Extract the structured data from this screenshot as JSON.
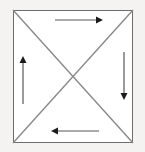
{
  "figure": {
    "background_color": "#f4f3f1",
    "fill_color": "#ffffff",
    "outline_color": "#6d6d6d",
    "diagonal_color": "#8a8a8a",
    "arrow_color": "#1c1c1c",
    "square": {
      "left": 13,
      "top": 10,
      "right": 133,
      "bottom": 143,
      "width": 120,
      "height": 133
    },
    "center": {
      "x": 73,
      "y": 76.5
    },
    "regions": [
      {
        "name": "top-triangle",
        "arrow": "right"
      },
      {
        "name": "right-triangle",
        "arrow": "down"
      },
      {
        "name": "bottom-triangle",
        "arrow": "left"
      },
      {
        "name": "left-triangle",
        "arrow": "up"
      }
    ],
    "arrows": [
      {
        "name": "top-arrow-right",
        "direction": "right",
        "from": {
          "x": 55,
          "y": 20
        },
        "to": {
          "x": 103,
          "y": 20
        }
      },
      {
        "name": "right-arrow-down",
        "direction": "down",
        "from": {
          "x": 124,
          "y": 52
        },
        "to": {
          "x": 124,
          "y": 100
        }
      },
      {
        "name": "bottom-arrow-left",
        "direction": "left",
        "from": {
          "x": 99,
          "y": 131
        },
        "to": {
          "x": 51,
          "y": 131
        }
      },
      {
        "name": "left-arrow-up",
        "direction": "up",
        "from": {
          "x": 23,
          "y": 104
        },
        "to": {
          "x": 23,
          "y": 56
        }
      }
    ],
    "circulation": "clockwise"
  }
}
